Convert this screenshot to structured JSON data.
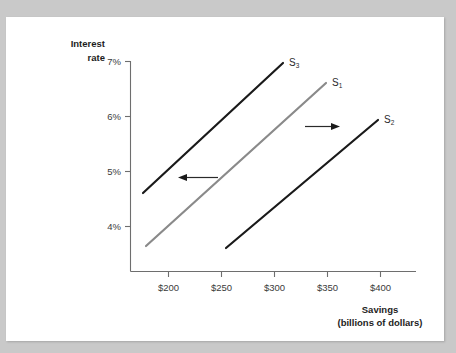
{
  "page": {
    "background_color": "#c9c9c9",
    "sheet_color": "#ffffff"
  },
  "chart_data": {
    "type": "line",
    "title": "",
    "subtitle": "",
    "xlabel_line1": "Savings",
    "xlabel_line2": "(billions of dollars)",
    "ylabel_line1": "Interest",
    "ylabel_line2": "rate",
    "x_ticks": [
      "$200",
      "$250",
      "$300",
      "$350",
      "$400"
    ],
    "x_tick_values": [
      200,
      250,
      300,
      350,
      400
    ],
    "y_ticks": [
      "7%",
      "6%",
      "5%",
      "4%"
    ],
    "y_tick_values": [
      7,
      6,
      5,
      4
    ],
    "xlim": [
      160,
      420
    ],
    "ylim": [
      3.2,
      7.4
    ],
    "grid": false,
    "legend": "none",
    "series": [
      {
        "name": "S3",
        "label": "S",
        "subscript": "3",
        "color": "#1a1a1a",
        "stroke_width": 2.2,
        "x": [
          185,
          305
        ],
        "y": [
          4.55,
          7.05
        ],
        "note": "leftward-shifted savings supply curve"
      },
      {
        "name": "S1",
        "label": "S",
        "subscript": "1",
        "color": "#8a8a8a",
        "stroke_width": 2.2,
        "x": [
          188,
          348
        ],
        "y": [
          3.58,
          6.7
        ],
        "note": "original savings supply curve"
      },
      {
        "name": "S2",
        "label": "S",
        "subscript": "2",
        "color": "#1a1a1a",
        "stroke_width": 2.2,
        "x": [
          264,
          400
        ],
        "y": [
          3.6,
          6.05
        ],
        "note": "rightward-shifted savings supply curve"
      }
    ],
    "annotations": [
      {
        "name": "left-shift-arrow",
        "direction": "left",
        "x_start": 375,
        "x_end": 300,
        "y": 4.85,
        "color": "#1a1a1a",
        "note": "shift from S1 to S3"
      },
      {
        "name": "right-shift-arrow",
        "direction": "right",
        "x_start": 398,
        "x_end": 452,
        "y": 5.78,
        "color": "#1a1a1a",
        "note": "shift from S1 to S2"
      }
    ]
  }
}
